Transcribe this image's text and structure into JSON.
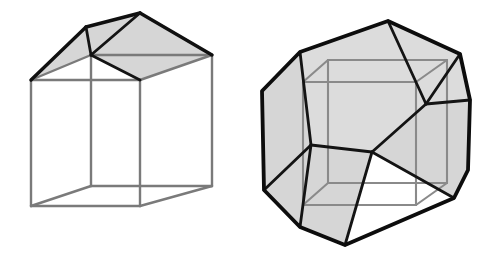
{
  "figure": {
    "background_color": "#ffffff",
    "canvas": {
      "width": 495,
      "height": 262
    },
    "caption": "",
    "palette": {
      "face_fill": "#d6d6d6",
      "face_fill_light": "#dcdcdc",
      "face_white": "#ffffff",
      "edge_gray": "#7a7a7a",
      "edge_black": "#101010",
      "background": "#ffffff"
    }
  },
  "shapes": [
    {
      "id": "left-shape",
      "name": "cube-with-prism-roof",
      "label": "",
      "description": "Transparent cube wireframe topped by a shaded triangular prism roof",
      "edge_style": "gray wireframe with black roof outline",
      "fill": "#d6d6d6",
      "vertices": {
        "cube_front_bottom_left": [
          31,
          206
        ],
        "cube_front_bottom_right": [
          140,
          206
        ],
        "cube_front_top_left": [
          31,
          80
        ],
        "cube_front_top_right": [
          140,
          80
        ],
        "cube_back_bottom_left": [
          91,
          186
        ],
        "cube_back_bottom_right": [
          212,
          186
        ],
        "cube_back_top_left": [
          91,
          55
        ],
        "cube_back_top_right": [
          212,
          55
        ],
        "roof_ridge_front": [
          86,
          27
        ],
        "roof_ridge_back": [
          140,
          13
        ]
      },
      "roof_faces": [
        {
          "name": "roof-left-slope",
          "points": "31,80 86,27 140,13 91,55"
        },
        {
          "name": "roof-right-slope",
          "points": "91,55 140,13 212,55 140,80"
        }
      ],
      "gray_edges": [
        "31,80 31,206",
        "140,80 140,206",
        "212,55 212,186",
        "91,55 91,186",
        "31,206 140,206",
        "31,206 91,186",
        "140,206 212,186",
        "91,186 212,186",
        "31,80 140,80",
        "140,80 212,55",
        "91,55 212,55",
        "31,80 91,55"
      ],
      "black_edges": [
        "31,80 86,27",
        "86,27 140,13",
        "140,13 212,55",
        "86,27 91,55",
        "91,55 140,13",
        "91,55 140,80"
      ]
    },
    {
      "id": "right-shape",
      "name": "truncated-cube-polyhedron",
      "label": "",
      "description": "Cube with corners truncated forming a shaded multi-faceted polyhedron",
      "edge_style": "black outline with gray inner cube wireframe",
      "fill": "#d6d6d6",
      "outline": "388,21 460,54 470,100 468,170 454,198 345,245 300,227 264,190 262,91 300,52",
      "inner_cube_vertices": {
        "front_top_left": [
          303,
          82
        ],
        "front_top_right": [
          416,
          82
        ],
        "front_bottom_left": [
          303,
          205
        ],
        "front_bottom_right": [
          416,
          205
        ],
        "back_top_left": [
          328,
          60
        ],
        "back_top_right": [
          447,
          60
        ],
        "back_bottom_left": [
          328,
          183
        ],
        "back_bottom_right": [
          447,
          183
        ]
      },
      "gray_edges": [
        "303,82 416,82",
        "303,82 303,205",
        "416,82 416,205",
        "303,205 416,205",
        "328,60 447,60",
        "328,60 328,183",
        "447,60 447,183",
        "328,183 447,183",
        "303,82 328,60",
        "416,82 447,60",
        "303,205 328,183",
        "416,205 447,183"
      ],
      "truncation_edges": [
        "300,52 388,21",
        "388,21 460,54",
        "460,54 470,100",
        "470,100 468,170",
        "468,170 454,198",
        "454,198 345,245",
        "345,245 300,227",
        "300,227 264,190",
        "264,190 262,91",
        "262,91 300,52",
        "300,52 311,145",
        "311,145 264,190",
        "311,145 372,152",
        "372,152 426,104",
        "426,104 388,21",
        "426,104 470,100",
        "426,104 460,54",
        "372,152 345,245",
        "311,145 300,227",
        "372,152 454,198"
      ]
    }
  ]
}
